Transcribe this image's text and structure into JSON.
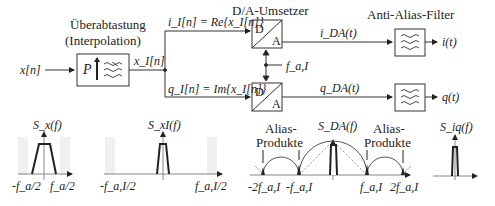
{
  "blocks": {
    "oversampling": {
      "title_line1": "Überabtastung",
      "title_line2": "(Interpolation)",
      "factor": "P",
      "filter_icon": "lowpass-filter-icon"
    },
    "dac": {
      "title": "D/A-Umsetzer",
      "top": "D",
      "bottom": "A"
    },
    "anti_alias": {
      "title": "Anti-Alias-Filter",
      "filter_icon": "lowpass-filter-icon"
    }
  },
  "signals": {
    "input": "x[n]",
    "interpolated": "x_I[n]",
    "i_branch": "i_I[n] = Re{x_I[n]}",
    "q_branch": "q_I[n] = Im{x_I[n]}",
    "i_da": "i_DA(t)",
    "q_da": "q_DA(t)",
    "clock": "f_a,I",
    "i_out": "i(t)",
    "q_out": "q(t)"
  },
  "spectra": [
    {
      "title": "S_x(f)",
      "ticks": [
        "-f_a/2",
        "f_a/2"
      ]
    },
    {
      "title": "S_xI(f)",
      "ticks": [
        "-f_a,I/2",
        "f_a,I/2"
      ]
    },
    {
      "title": "S_DA(f)",
      "annotations": [
        "Alias-Produkte",
        "Alias-Produkte"
      ],
      "ticks": [
        "-2f_a,I",
        "-f_a,I",
        "f_a,I",
        "2f_a,I"
      ]
    },
    {
      "title": "S_iq(f)",
      "ticks": []
    }
  ],
  "text": {
    "uber": "Überabtastung",
    "interp": "(Interpolation)",
    "P": "P",
    "da_title": "D/A-Umsetzer",
    "aaf_title": "Anti-Alias-Filter",
    "D": "D",
    "A": "A",
    "alias": "Alias-",
    "produkte": "Produkte"
  }
}
